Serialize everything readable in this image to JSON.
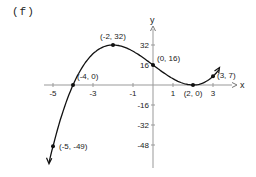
{
  "panel_label": "(f)",
  "chart_data": {
    "type": "line",
    "title": "",
    "function": "f(x) = x^3 - 12x + 16",
    "xlabel": "x",
    "ylabel": "y",
    "x_ticks": [
      -5,
      -3,
      -1,
      1,
      3
    ],
    "y_ticks": [
      32,
      16,
      -16,
      -32,
      -48
    ],
    "xlim": [
      -5.2,
      3.6
    ],
    "ylim": [
      -52,
      48
    ],
    "grid": false,
    "labeled_points": [
      {
        "x": -5,
        "y": -49,
        "label": "(-5, -49)"
      },
      {
        "x": -4,
        "y": 0,
        "label": "(-4, 0)"
      },
      {
        "x": -2,
        "y": 32,
        "label": "(-2, 32)"
      },
      {
        "x": 0,
        "y": 16,
        "label": "(0, 16)"
      },
      {
        "x": 2,
        "y": 0,
        "label": "(2, 0)"
      },
      {
        "x": 3,
        "y": 7,
        "label": "(3, 7)"
      }
    ],
    "curve_x": [
      -5.2,
      -5,
      -4.5,
      -4,
      -3.5,
      -3,
      -2.5,
      -2,
      -1.5,
      -1,
      -0.5,
      0,
      0.5,
      1,
      1.5,
      2,
      2.5,
      3,
      3.3
    ],
    "curve_y": [
      -62.2,
      -49,
      -21.1,
      0,
      15.1,
      25,
      30.4,
      32,
      30.6,
      27,
      22.0,
      16,
      10.1,
      5,
      1.4,
      0,
      1.6,
      7,
      12.3
    ],
    "arrows": [
      "both-ends"
    ]
  }
}
